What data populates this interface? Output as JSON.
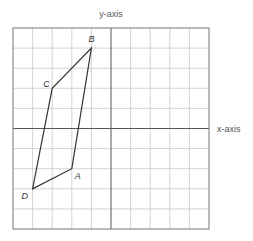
{
  "diagram": {
    "type": "coordinate-grid",
    "x_axis_label": "x-axis",
    "y_axis_label": "y-axis",
    "grid": {
      "x_range": [
        -5,
        5
      ],
      "y_range": [
        -5,
        5
      ],
      "step": 1
    },
    "polygon": {
      "vertices": [
        {
          "name": "A",
          "x": -2,
          "y": -2
        },
        {
          "name": "B",
          "x": -1,
          "y": 4
        },
        {
          "name": "C",
          "x": -3,
          "y": 2
        },
        {
          "name": "D",
          "x": -4,
          "y": -3
        }
      ],
      "order": [
        "A",
        "B",
        "C",
        "D"
      ]
    },
    "colors": {
      "grid": "#c8c8c8",
      "border": "#777777",
      "axis": "#555555",
      "polygon": "#333333"
    }
  }
}
